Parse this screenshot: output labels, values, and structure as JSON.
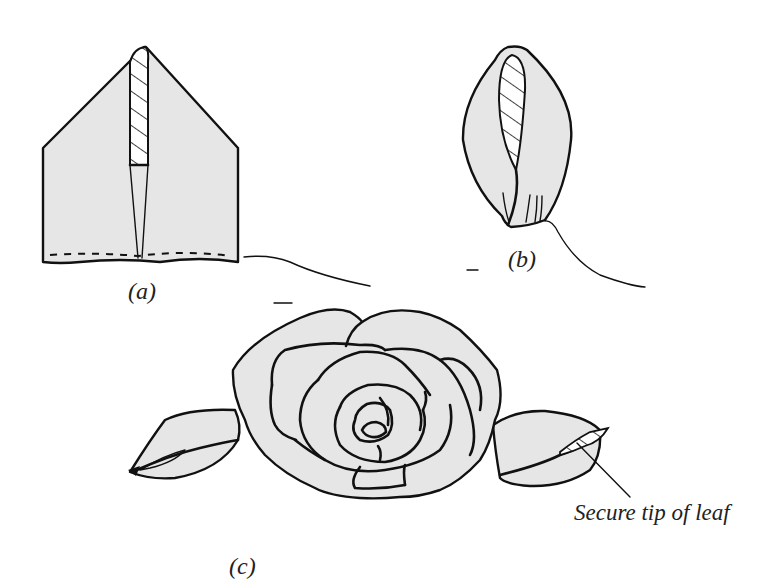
{
  "figure": {
    "type": "sewing-instruction-illustration",
    "panels": [
      {
        "id": "a",
        "label": "(a)",
        "depicts": "folded fabric square with hatched strip and dashed gathering stitch along bottom edge"
      },
      {
        "id": "b",
        "label": "(b)",
        "depicts": "fabric folded and gathered into a leaf shape with thread tail"
      },
      {
        "id": "c",
        "label": "(c)",
        "depicts": "completed fabric rose with a leaf on each side"
      }
    ],
    "annotation": "Secure tip of leaf",
    "colors": {
      "fabric_fill": "#e6e6e6",
      "ink": "#111111",
      "background": "#ffffff"
    }
  }
}
